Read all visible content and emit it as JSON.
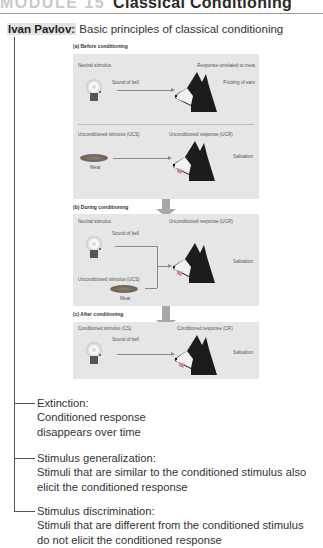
{
  "header": {
    "module": "MODULE 15",
    "title": "Classical Conditioning"
  },
  "topic": {
    "name": "Ivan Pavlov:",
    "subtitle": "Basic principles of classical conditioning"
  },
  "figure": {
    "panels": [
      {
        "label": "(a) Before conditioning",
        "rows": [
          {
            "stimulus_label": "Neutral stimulus",
            "stimulus_item": "Sound of bell",
            "stimulus_icon": "bell-icon",
            "response_label": "Response unrelated to meat",
            "response_item": "Pricking of ears",
            "response_icon": "dog-icon"
          },
          {
            "stimulus_label": "Unconditioned stimulus (UCS)",
            "stimulus_item": "Meat",
            "stimulus_icon": "meat-icon",
            "response_label": "Unconditioned response (UCR)",
            "response_item": "Salivation",
            "response_icon": "dog-salivating-icon"
          }
        ]
      },
      {
        "label": "(b) During conditioning",
        "neutral_label": "Neutral stimulus",
        "neutral_item": "Sound of bell",
        "ucs_label": "Unconditioned stimulus (UCS)",
        "ucs_item": "Meat",
        "response_label": "Unconditioned response (UCR)",
        "response_item": "Salivation"
      },
      {
        "label": "(c) After conditioning",
        "stimulus_label": "Conditioned stimulus (CS)",
        "stimulus_item": "Sound of bell",
        "response_label": "Conditioned response (CR)",
        "response_item": "Salivation"
      }
    ]
  },
  "concepts": [
    {
      "term": "Extinction:",
      "lines": [
        "Conditioned response",
        "disappears over time"
      ]
    },
    {
      "term": "Stimulus generalization:",
      "lines": [
        "Stimuli that are similar to the conditioned stimulus also",
        "elicit the conditioned response"
      ]
    },
    {
      "term": "Stimulus discrimination:",
      "lines": [
        "Stimuli that are different from the conditioned stimulus",
        "do not elicit the conditioned response"
      ]
    }
  ],
  "colors": {
    "panel_bg": "#e6e6e6",
    "name_highlight": "#e2e2e2",
    "module_grey": "#c9c9c9",
    "arrow_grey": "#a8a8a8"
  }
}
